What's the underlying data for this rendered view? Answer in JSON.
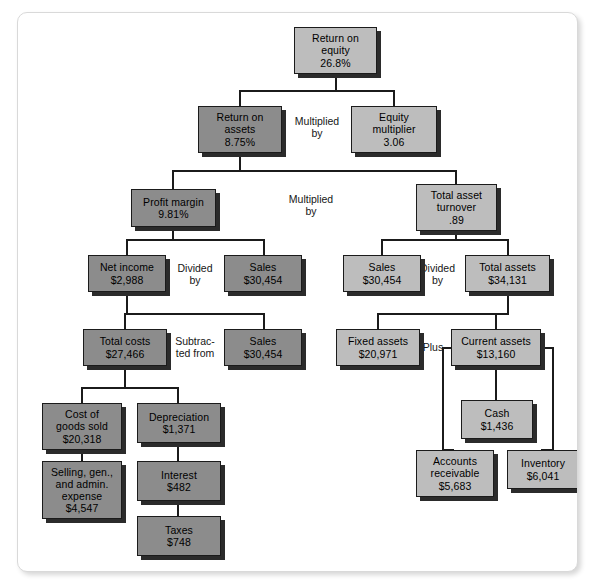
{
  "diagram": {
    "colors": {
      "node_dark": "#8c8c8c",
      "node_light": "#bdbdbd",
      "node_border": "#1b1b1b",
      "connector": "#1b1b1b",
      "card_background": "#ffffff",
      "page_background": "#ffffff"
    },
    "nodes": [
      {
        "id": "roe",
        "line1": "Return on",
        "line2": "equity",
        "line3": "26.8%",
        "shade": "light",
        "x": 276,
        "y": 14,
        "w": 83,
        "h": 47
      },
      {
        "id": "roa",
        "line1": "Return on",
        "line2": "assets",
        "line3": "8.75%",
        "shade": "dark",
        "x": 180,
        "y": 93,
        "w": 84,
        "h": 47
      },
      {
        "id": "equity-multiplier",
        "line1": "Equity",
        "line2": "multiplier",
        "line3": "3.06",
        "shade": "light",
        "x": 333,
        "y": 93,
        "w": 86,
        "h": 47
      },
      {
        "id": "profit-margin",
        "line1": "Profit margin",
        "line2": "9.81%",
        "line3": "",
        "shade": "dark",
        "x": 113,
        "y": 176,
        "w": 85,
        "h": 38
      },
      {
        "id": "total-asset-turnover",
        "line1": "Total asset",
        "line2": "turnover",
        "line3": ".89",
        "shade": "light",
        "x": 398,
        "y": 171,
        "w": 81,
        "h": 47
      },
      {
        "id": "net-income",
        "line1": "Net income",
        "line2": "$2,988",
        "line3": "",
        "shade": "dark",
        "x": 70,
        "y": 242,
        "w": 78,
        "h": 37
      },
      {
        "id": "sales-pm",
        "line1": "Sales",
        "line2": "$30,454",
        "line3": "",
        "shade": "dark",
        "x": 206,
        "y": 242,
        "w": 78,
        "h": 37
      },
      {
        "id": "sales-tat",
        "line1": "Sales",
        "line2": "$30,454",
        "line3": "",
        "shade": "light",
        "x": 325,
        "y": 242,
        "w": 78,
        "h": 37
      },
      {
        "id": "total-assets",
        "line1": "Total assets",
        "line2": "$34,131",
        "line3": "",
        "shade": "light",
        "x": 447,
        "y": 242,
        "w": 85,
        "h": 37
      },
      {
        "id": "total-costs",
        "line1": "Total costs",
        "line2": "$27,466",
        "line3": "",
        "shade": "dark",
        "x": 65,
        "y": 316,
        "w": 84,
        "h": 37
      },
      {
        "id": "sales-tc",
        "line1": "Sales",
        "line2": "$30,454",
        "line3": "",
        "shade": "dark",
        "x": 206,
        "y": 316,
        "w": 78,
        "h": 37
      },
      {
        "id": "fixed-assets",
        "line1": "Fixed assets",
        "line2": "$20,971",
        "line3": "",
        "shade": "light",
        "x": 318,
        "y": 316,
        "w": 84,
        "h": 37
      },
      {
        "id": "current-assets",
        "line1": "Current assets",
        "line2": "$13,160",
        "line3": "",
        "shade": "light",
        "x": 433,
        "y": 316,
        "w": 90,
        "h": 37
      },
      {
        "id": "cogs",
        "line1": "Cost of",
        "line2": "goods sold",
        "line3": "$20,318",
        "shade": "dark",
        "x": 24,
        "y": 390,
        "w": 80,
        "h": 47
      },
      {
        "id": "depreciation",
        "line1": "Depreciation",
        "line2": "$1,371",
        "line3": "",
        "shade": "dark",
        "x": 119,
        "y": 390,
        "w": 84,
        "h": 40
      },
      {
        "id": "cash",
        "line1": "Cash",
        "line2": "$1,436",
        "line3": "",
        "shade": "light",
        "x": 443,
        "y": 387,
        "w": 72,
        "h": 39
      },
      {
        "id": "sga",
        "line1": "Selling, gen.,",
        "line2": "and admin.",
        "line3": "expense",
        "line4": "$4,547",
        "shade": "dark",
        "x": 24,
        "y": 448,
        "w": 80,
        "h": 58
      },
      {
        "id": "interest",
        "line1": "Interest",
        "line2": "$482",
        "line3": "",
        "shade": "dark",
        "x": 119,
        "y": 448,
        "w": 84,
        "h": 40
      },
      {
        "id": "accounts-receivable",
        "line1": "Accounts",
        "line2": "receivable",
        "line3": "$5,683",
        "shade": "light",
        "x": 398,
        "y": 437,
        "w": 78,
        "h": 47
      },
      {
        "id": "inventory",
        "line1": "Inventory",
        "line2": "$6,041",
        "line3": "",
        "shade": "light",
        "x": 489,
        "y": 437,
        "w": 72,
        "h": 39
      },
      {
        "id": "taxes",
        "line1": "Taxes",
        "line2": "$748",
        "line3": "",
        "shade": "dark",
        "x": 119,
        "y": 503,
        "w": 84,
        "h": 40
      }
    ],
    "operator_labels": [
      {
        "id": "multiplied-by-top",
        "text": "Multiplied\nby",
        "x": 265,
        "y": 102,
        "w": 68
      },
      {
        "id": "multiplied-by-mid",
        "text": "Multiplied\nby",
        "x": 248,
        "y": 180,
        "w": 90
      },
      {
        "id": "divided-by-left",
        "text": "Divided\nby",
        "x": 148,
        "y": 249,
        "w": 58
      },
      {
        "id": "divided-by-right",
        "text": "Divided\nby",
        "x": 392,
        "y": 249,
        "w": 55
      },
      {
        "id": "subtracted-from",
        "text": "Subtrac-\nted from",
        "x": 148,
        "y": 322,
        "w": 58
      },
      {
        "id": "plus",
        "text": "Plus",
        "x": 404,
        "y": 328,
        "w": 30
      }
    ]
  }
}
